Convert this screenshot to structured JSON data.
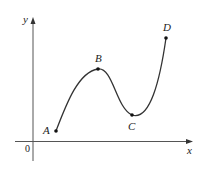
{
  "figure": {
    "axes": {
      "x_label": "x",
      "y_label": "y",
      "origin_label": "0"
    },
    "points": [
      {
        "id": "A",
        "label": "A",
        "px": 56,
        "py": 131
      },
      {
        "id": "B",
        "label": "B",
        "px": 98,
        "py": 69
      },
      {
        "id": "C",
        "label": "C",
        "px": 132,
        "py": 115
      },
      {
        "id": "D",
        "label": "D",
        "px": 166,
        "py": 38
      }
    ],
    "colors": {
      "axis": "#555555",
      "curve": "#333333",
      "point": "#111111",
      "text": "#222222"
    }
  }
}
